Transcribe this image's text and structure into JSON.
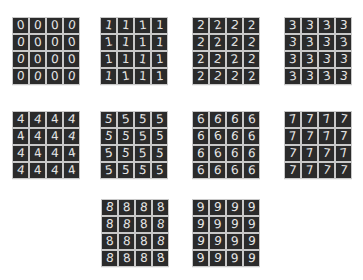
{
  "figure": {
    "tile_color": "#2b2b2b",
    "digit_color": "#e6e6e6",
    "background": "#ffffff",
    "grids": [
      {
        "label": "0",
        "x": 12,
        "y": 17
      },
      {
        "label": "1",
        "x": 100,
        "y": 17
      },
      {
        "label": "2",
        "x": 192,
        "y": 17
      },
      {
        "label": "3",
        "x": 284,
        "y": 17
      },
      {
        "label": "4",
        "x": 12,
        "y": 111
      },
      {
        "label": "5",
        "x": 100,
        "y": 111
      },
      {
        "label": "6",
        "x": 192,
        "y": 111
      },
      {
        "label": "7",
        "x": 284,
        "y": 111
      },
      {
        "label": "8",
        "x": 101,
        "y": 199
      },
      {
        "label": "9",
        "x": 192,
        "y": 199
      }
    ]
  }
}
